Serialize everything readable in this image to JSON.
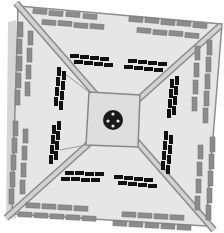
{
  "diagram": {
    "title": "",
    "type": "top-down plaza plan",
    "colors": {
      "background": "#ffffff",
      "plaza_floor": "#e4e4e4",
      "plaza_edge": "#8e8e8e",
      "walkway": "#c8c8c8",
      "walkway_edge": "#8a8a8a",
      "gray_bench": "#8c8c8c",
      "gray_bench_edge": "#6e6e6e",
      "black_bench": "#111111",
      "center_square": "#d8d8d8",
      "center_circle": "#1a1a1a",
      "center_dots": "#e8e8e8",
      "shadow": "#cfcfcf"
    },
    "elements": {
      "plaza": "square plaza viewed from above",
      "diagonal_walkways": 2,
      "center_feature": "circular fountain in central square",
      "outer_gray_bench_rows": 8,
      "inner_black_bench_clusters": 8
    }
  }
}
